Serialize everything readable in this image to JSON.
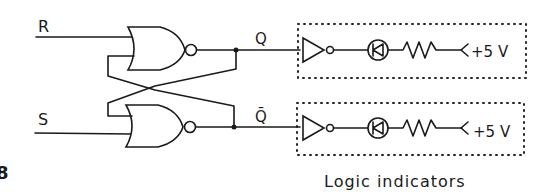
{
  "diagram": {
    "figure_marker": "8",
    "inputs": {
      "r_label": "R",
      "s_label": "S"
    },
    "outputs": {
      "q_label": "Q",
      "qbar_label": "Q̄"
    },
    "indicators": [
      {
        "supply_label": "+5 V"
      },
      {
        "supply_label": "+5 V"
      }
    ],
    "caption": "Logic indicators",
    "colors": {
      "ink": "#1a1a1a",
      "background": "#ffffff"
    }
  }
}
